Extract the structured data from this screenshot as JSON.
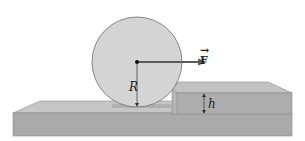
{
  "diagram": {
    "labels": {
      "force": "F",
      "force_vector_mark": "→",
      "radius": "R",
      "step_height": "h"
    },
    "colors": {
      "wheel_fill": "#d4d4d4",
      "wheel_stroke": "#7a7a7a",
      "base_top": "#c4c4c4",
      "base_front": "#a9a9a9",
      "step_top": "#c0c0c0",
      "step_front": "#acacac",
      "step_side": "#b8b8b8",
      "arrow": "#5a5a5a"
    }
  }
}
